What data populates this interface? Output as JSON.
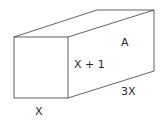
{
  "diagram": {
    "type": "rectangular-prism",
    "labels": {
      "face_area": "A",
      "height": "X + 1",
      "length": "3X",
      "width": "X"
    },
    "colors": {
      "stroke": "#3a3a3a",
      "text": "#2a2a2a",
      "background": "#ffffff"
    }
  }
}
